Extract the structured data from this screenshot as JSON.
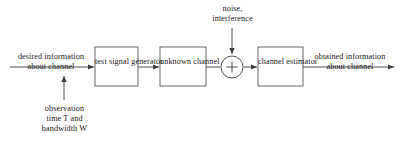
{
  "diagram": {
    "blocks": [
      {
        "id": "test-signal-generator",
        "line1": "test signal",
        "line2": "generator"
      },
      {
        "id": "unknown-channel",
        "line1": "unknown",
        "line2": "channel"
      },
      {
        "id": "channel-estimator",
        "line1": "channel",
        "line2": "estimator"
      }
    ],
    "input_label": {
      "line1": "desired information",
      "line2": "about channel"
    },
    "output_label": {
      "line1": "obtained information",
      "line2": "about channel"
    },
    "noise_label": {
      "line1": "noise,",
      "line2": "interference"
    },
    "observation_label": {
      "line1": "observation",
      "line2": "time T and",
      "line3": "bandwidth W"
    },
    "summing_junction": {
      "operator": "+"
    },
    "colors": {
      "background": "#ffffff",
      "stroke": "#3c3c3c",
      "box_stroke": "#555555",
      "text": "#1a1a1a"
    }
  }
}
